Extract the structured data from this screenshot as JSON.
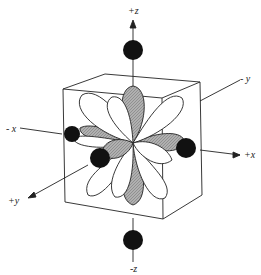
{
  "diagram": {
    "axes": {
      "pos_z": "+z",
      "neg_z": "-z",
      "pos_x": "+x",
      "neg_x": "- x",
      "pos_y": "+y",
      "neg_y": "- y"
    },
    "colors": {
      "ligand": "#111111",
      "lobe_shaded": "#a8a8a8",
      "lobe_plain": "#ffffff",
      "line": "#222222"
    }
  }
}
